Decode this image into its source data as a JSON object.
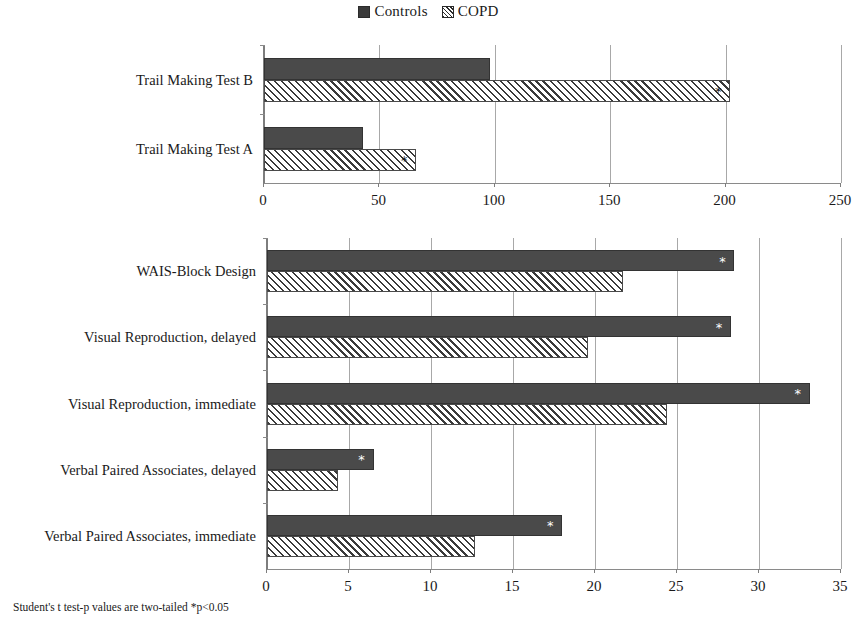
{
  "legend": {
    "items": [
      {
        "label": "Controls",
        "marker": "solid-square-swatch",
        "color": "#3a3a3a"
      },
      {
        "label": "COPD",
        "marker": "hatched-square-swatch",
        "color": "#2b2b2b"
      }
    ]
  },
  "footnote": "Student's t test-p values are two-tailed *p<0.05",
  "significance_marker": "*",
  "chart_data": [
    {
      "type": "bar",
      "orientation": "horizontal",
      "title": "",
      "xlabel": "",
      "ylabel": "",
      "xlim": [
        0,
        250
      ],
      "xticks": [
        0,
        50,
        100,
        150,
        200,
        250
      ],
      "ticklabels": [
        "0",
        "50",
        "100",
        "150",
        "200",
        "250"
      ],
      "grid": true,
      "legend_position": "top-center",
      "categories": [
        "Trail Making Test A",
        "Trail Making Test B"
      ],
      "series": [
        {
          "name": "Controls",
          "values": [
            43,
            98
          ],
          "significant": [
            false,
            false
          ]
        },
        {
          "name": "COPD",
          "values": [
            66,
            202
          ],
          "significant": [
            true,
            true
          ]
        }
      ]
    },
    {
      "type": "bar",
      "orientation": "horizontal",
      "title": "",
      "xlabel": "",
      "ylabel": "",
      "xlim": [
        0,
        35
      ],
      "xticks": [
        0,
        5,
        10,
        15,
        20,
        25,
        30,
        35
      ],
      "ticklabels": [
        "0",
        "5",
        "10",
        "15",
        "20",
        "25",
        "30",
        "35"
      ],
      "grid": true,
      "legend_position": "top-center",
      "categories": [
        "Verbal Paired Associates, immediate",
        "Verbal Paired Associates, delayed",
        "Visual Reproduction, immediate",
        "Visual Reproduction, delayed",
        "WAIS-Block Design"
      ],
      "series": [
        {
          "name": "Controls",
          "values": [
            18.0,
            6.5,
            33.1,
            28.3,
            28.5
          ],
          "significant": [
            true,
            true,
            true,
            true,
            true
          ]
        },
        {
          "name": "COPD",
          "values": [
            12.7,
            4.3,
            24.4,
            19.6,
            21.7
          ],
          "significant": [
            false,
            false,
            false,
            false,
            false
          ]
        }
      ]
    }
  ]
}
